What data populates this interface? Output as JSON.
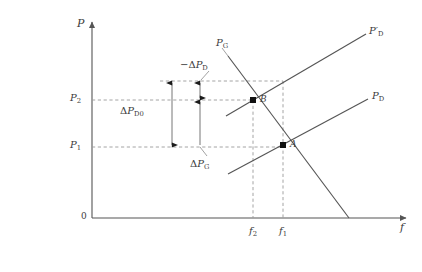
{
  "figure": {
    "type": "economics-supply-demand-diagram",
    "width": 422,
    "height": 272,
    "background": "#ffffff",
    "line_color": "#555555",
    "dash_color": "#999999",
    "text_color": "#3b3b3b"
  },
  "axes": {
    "y_axis_label": "P",
    "x_axis_label": "f",
    "origin_label": "0",
    "origin_px": {
      "x": 92,
      "y": 218
    },
    "y_top_px": 18,
    "x_right_px": 410
  },
  "y_ticks": [
    {
      "id": "P2",
      "base": "P",
      "sub": "2",
      "value_px": 100,
      "label": "P₂"
    },
    {
      "id": "P1",
      "base": "P",
      "sub": "1",
      "value_px": 147,
      "label": "P₁"
    }
  ],
  "x_ticks": [
    {
      "id": "f2",
      "base": "f",
      "sub": "2",
      "value_px": 254,
      "label": "f₂"
    },
    {
      "id": "f1",
      "base": "f",
      "sub": "1",
      "value_px": 283,
      "label": "f₁"
    }
  ],
  "curves": [
    {
      "id": "PG",
      "base": "P",
      "sub": "G",
      "prime": false,
      "label": "P_G",
      "label_px": {
        "x": 216,
        "y": 40
      },
      "from_px": {
        "x": 228,
        "y": 56
      },
      "to_px": {
        "x": 349,
        "y": 218
      },
      "role": "supply-curve-downward"
    },
    {
      "id": "PD_prime",
      "base": "P",
      "sub": "D",
      "prime": true,
      "label": "P'_D",
      "label_px": {
        "x": 370,
        "y": 27
      },
      "from_px": {
        "x": 226,
        "y": 116
      },
      "to_px": {
        "x": 366,
        "y": 34
      },
      "role": "shifted-demand-curve"
    },
    {
      "id": "PD",
      "base": "P",
      "sub": "D",
      "prime": false,
      "label": "P_D",
      "label_px": {
        "x": 373,
        "y": 92
      },
      "from_px": {
        "x": 228,
        "y": 174
      },
      "to_px": {
        "x": 368,
        "y": 99
      },
      "role": "original-demand-curve"
    }
  ],
  "points": [
    {
      "id": "B",
      "label": "B",
      "px": {
        "x": 253,
        "y": 100
      },
      "label_px": {
        "x": 260,
        "y": 96
      }
    },
    {
      "id": "A",
      "label": "A",
      "px": {
        "x": 283,
        "y": 145
      },
      "label_px": {
        "x": 290,
        "y": 141
      }
    }
  ],
  "guides": {
    "horizontal_dashed": [
      {
        "id": "top-level",
        "y_px": 81,
        "x1_px": 160,
        "x2_px": 283
      },
      {
        "id": "P2-level",
        "y_px": 100,
        "x1_px": 92,
        "x2_px": 253
      },
      {
        "id": "P1-level",
        "y_px": 147,
        "x1_px": 92,
        "x2_px": 283
      }
    ],
    "vertical_dashed": [
      {
        "id": "f2-line",
        "x_px": 253,
        "y1_px": 100,
        "y2_px": 218
      },
      {
        "id": "f1-line",
        "x_px": 283,
        "y1_px": 81,
        "y2_px": 218
      }
    ]
  },
  "annotations": [
    {
      "id": "delta-PD0",
      "label": "ΔP_D0",
      "parts": {
        "delta": "Δ",
        "base": "P",
        "sub": "D0"
      },
      "arrow": {
        "type": "double-headed",
        "x_px": 172,
        "y1_px": 81,
        "y2_px": 147
      },
      "label_px": {
        "x": 122,
        "y": 107
      }
    },
    {
      "id": "neg-delta-PD",
      "label": "-ΔP_D",
      "parts": {
        "sign": "−",
        "delta": "Δ",
        "base": "P",
        "sub": "D"
      },
      "arrow": {
        "type": "double-headed",
        "x_px": 200,
        "y1_px": 81,
        "y2_px": 100
      },
      "leader": {
        "x1_px": 200,
        "y1_px": 83,
        "x2_px": 209,
        "y2_px": 74
      },
      "label_px": {
        "x": 182,
        "y": 61
      }
    },
    {
      "id": "delta-PG",
      "label": "ΔP_G",
      "parts": {
        "delta": "Δ",
        "base": "P",
        "sub": "G"
      },
      "arrow": {
        "type": "single-headed-up",
        "x_px": 200,
        "y1_px": 147,
        "y2_px": 100
      },
      "leader": {
        "x1_px": 200,
        "y1_px": 145,
        "x2_px": 209,
        "y2_px": 154
      },
      "label_px": {
        "x": 192,
        "y": 161
      }
    }
  ]
}
